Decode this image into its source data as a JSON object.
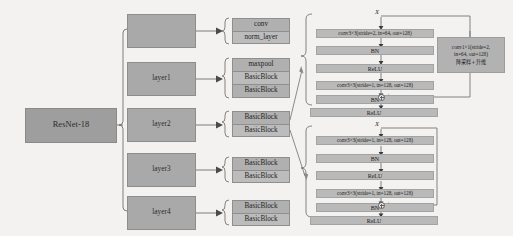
{
  "diagram": {
    "root": {
      "label": "ResNet-18"
    },
    "stages": [
      {
        "name": "stem",
        "label": ""
      },
      {
        "name": "layer1",
        "label": "layer1"
      },
      {
        "name": "layer2",
        "label": "layer2"
      },
      {
        "name": "layer3",
        "label": "layer3"
      },
      {
        "name": "layer4",
        "label": "layer4"
      }
    ],
    "stage_contents": [
      {
        "name": "stem-contents",
        "rows": [
          "conv",
          "norm_layer"
        ]
      },
      {
        "name": "layer1-contents",
        "rows": [
          "maxpool",
          "BasicBlock",
          "BasicBlock"
        ]
      },
      {
        "name": "layer2-contents",
        "rows": [
          "BasicBlock",
          "BasicBlock"
        ]
      },
      {
        "name": "layer3-contents",
        "rows": [
          "BasicBlock",
          "BasicBlock"
        ]
      },
      {
        "name": "layer4-contents",
        "rows": [
          "BasicBlock",
          "BasicBlock"
        ]
      }
    ],
    "detail_blocks": [
      {
        "name": "downsample-basicblock",
        "input_label": "X",
        "rows": [
          "conv3×3(stride=2, in=64, out=128)",
          "BN",
          "ReLU",
          "conv3×3(stride=1, in=128, out=128)",
          "BN"
        ],
        "output_row": "ReLU",
        "add_symbol": "+",
        "shortcut": {
          "line1": "conv1×1(stride=2,",
          "line2": "in=64, out=128)",
          "line3": "降采样+升维"
        }
      },
      {
        "name": "identity-basicblock",
        "input_label": "X",
        "rows": [
          "conv3×3(stride=1, in=128, out=128)",
          "BN",
          "ReLU",
          "conv3×3(stride=1, in=128, out=128)",
          "BN"
        ],
        "output_row": "ReLU",
        "add_symbol": "+",
        "shortcut": null
      }
    ],
    "colors": {
      "background": "#f3f2f0",
      "box_fill": "#a9a9a9",
      "bar_fill": "#b9b9b9",
      "stroke": "#6f6f6f"
    }
  }
}
